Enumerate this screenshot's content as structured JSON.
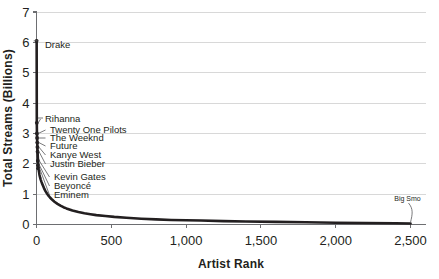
{
  "chart_data": {
    "type": "line",
    "title": "",
    "xlabel": "Artist Rank",
    "ylabel": "Total Streams (Billions)",
    "xlim": [
      0,
      2600
    ],
    "ylim": [
      0,
      7
    ],
    "xticks": [
      0,
      500,
      1000,
      1500,
      2000,
      2500
    ],
    "xticklabels": [
      "0",
      "500",
      "1,000",
      "1,500",
      "2,000",
      "2,500"
    ],
    "yticks": [
      0,
      1,
      2,
      3,
      4,
      5,
      6,
      7
    ],
    "yticklabels": [
      "0",
      "1",
      "2",
      "3",
      "4",
      "5",
      "6",
      "7"
    ],
    "grid": "horizontal",
    "legend": "none",
    "series_name": "Total streams by artist rank",
    "x": [
      1,
      2,
      3,
      4,
      5,
      6,
      7,
      8,
      9,
      10,
      12,
      14,
      16,
      18,
      20,
      24,
      28,
      32,
      36,
      40,
      50,
      60,
      70,
      80,
      90,
      100,
      120,
      140,
      160,
      180,
      200,
      240,
      280,
      320,
      360,
      400,
      460,
      520,
      600,
      700,
      800,
      900,
      1000,
      1100,
      1250,
      1400,
      1600,
      1800,
      2000,
      2200,
      2400,
      2500
    ],
    "y": [
      6.05,
      3.35,
      3.0,
      2.85,
      2.7,
      2.55,
      2.42,
      2.3,
      2.2,
      2.1,
      1.95,
      1.85,
      1.76,
      1.7,
      1.63,
      1.55,
      1.48,
      1.42,
      1.37,
      1.32,
      1.2,
      1.1,
      1.02,
      0.95,
      0.89,
      0.84,
      0.75,
      0.68,
      0.62,
      0.57,
      0.53,
      0.46,
      0.41,
      0.37,
      0.34,
      0.31,
      0.28,
      0.25,
      0.22,
      0.19,
      0.17,
      0.15,
      0.14,
      0.13,
      0.11,
      0.1,
      0.085,
      0.072,
      0.06,
      0.05,
      0.04,
      0.035
    ],
    "annotations": [
      {
        "label": "Drake",
        "rank": 1,
        "value": 6.05
      },
      {
        "label": "Rihanna",
        "rank": 2,
        "value": 3.35
      },
      {
        "label": "Twenty One Pilots",
        "rank": 3,
        "value": 3.0
      },
      {
        "label": "The Weeknd",
        "rank": 4,
        "value": 2.85
      },
      {
        "label": "Future",
        "rank": 5,
        "value": 2.7
      },
      {
        "label": "Kanye West",
        "rank": 6,
        "value": 2.55
      },
      {
        "label": "Justin Bieber",
        "rank": 7,
        "value": 2.4
      },
      {
        "label": "Kevin Gates",
        "rank": 9,
        "value": 2.1
      },
      {
        "label": "Beyoncé",
        "rank": 10,
        "value": 1.95
      },
      {
        "label": "Eminem",
        "rank": 11,
        "value": 1.85
      },
      {
        "label": "Big Smo",
        "rank": 2500,
        "value": 0.035
      }
    ]
  }
}
